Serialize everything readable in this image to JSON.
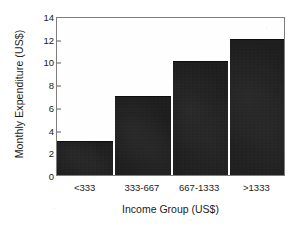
{
  "chart_data": {
    "type": "bar",
    "title": "",
    "subtitle": "",
    "xlabel": "Income Group (US$)",
    "ylabel": "Monthly Expenditure (US$)",
    "categories": [
      "<333",
      "333-667",
      "667-1333",
      ">1333"
    ],
    "values": [
      3,
      7,
      10,
      12
    ],
    "series": [
      {
        "name": "Monthly Expenditure",
        "values": [
          3,
          7,
          10,
          12
        ]
      }
    ],
    "ylim": [
      0,
      14
    ],
    "yticks": [
      0,
      2,
      4,
      6,
      8,
      10,
      12,
      14
    ],
    "ytick_labels": [
      "0",
      "2",
      "4",
      "6",
      "8",
      "10",
      "12",
      "14"
    ],
    "grid": false,
    "legend": null,
    "legend_position": "none",
    "annotations": [],
    "bar_color": "#151515",
    "frame_color": "#7d7d7d",
    "background_color": "#ffffff",
    "text_color": "#1a1a1a"
  }
}
